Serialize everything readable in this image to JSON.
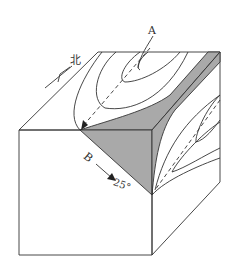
{
  "diagram": {
    "type": "geological-block-diagram",
    "labels": {
      "a": "A",
      "b": "B",
      "north": "北",
      "plunge": "25°"
    },
    "colors": {
      "stroke": "#333333",
      "shade": "#a9a9a9",
      "background": "#ffffff"
    }
  }
}
